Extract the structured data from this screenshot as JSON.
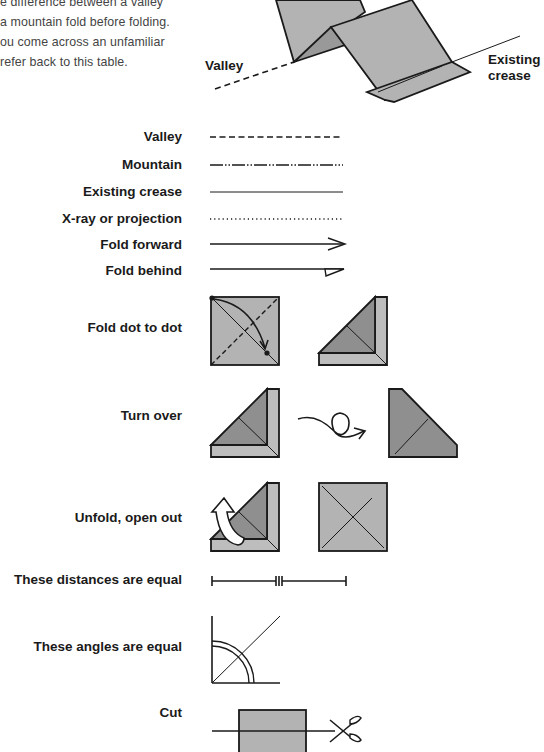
{
  "intro": {
    "lines": [
      "e difference between a valley",
      "a mountain fold before folding.",
      "ou come across an unfamiliar",
      "refer back to this table."
    ]
  },
  "diagram": {
    "valley_label": "Valley",
    "existing_crease_label_line1": "Existing",
    "existing_crease_label_line2": "crease"
  },
  "symbols": [
    {
      "label": "Valley",
      "symbol": "dashed-line"
    },
    {
      "label": "Mountain",
      "symbol": "dash-dot-dot-line"
    },
    {
      "label": "Existing crease",
      "symbol": "thin-solid-line"
    },
    {
      "label": "X-ray or projection",
      "symbol": "dotted-line"
    },
    {
      "label": "Fold forward",
      "symbol": "open-arrow"
    },
    {
      "label": "Fold behind",
      "symbol": "half-arrow"
    },
    {
      "label": "Fold dot to dot",
      "symbol": "square-dot-to-dot-diagram"
    },
    {
      "label": "Turn over",
      "symbol": "loop-arrow-diagram"
    },
    {
      "label": "Unfold, open out",
      "symbol": "hollow-arrow-diagram"
    },
    {
      "label": "These distances are equal",
      "symbol": "equal-distance-marks"
    },
    {
      "label": "These angles are equal",
      "symbol": "equal-angle-arcs"
    },
    {
      "label": "Cut",
      "symbol": "scissors-diagram"
    }
  ],
  "colors": {
    "paper": "#b3b3b3",
    "paper_dark": "#8f8f8f",
    "line": "#1a1a1a"
  }
}
